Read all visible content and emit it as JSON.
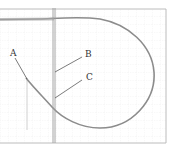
{
  "diagram": {
    "labels": [
      {
        "id": "A",
        "text": "A"
      },
      {
        "id": "B",
        "text": "B"
      },
      {
        "id": "C",
        "text": "C"
      }
    ],
    "colors": {
      "background": "#ffffff",
      "grid": "#e6e6e6",
      "frame": "#b0b0b0",
      "curve": "#8a8a8a",
      "line": "#9a9a9a",
      "leader": "#444444",
      "text": "#333333"
    }
  }
}
